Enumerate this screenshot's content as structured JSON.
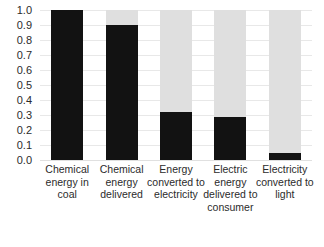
{
  "chart_data": {
    "type": "bar",
    "title": "",
    "subtitle": "",
    "xlabel": "",
    "ylabel": "",
    "categories": [
      "Chemical energy in coal",
      "Chemical energy delivered",
      "Energy converted to electricity",
      "Electric energy delivered to consumer",
      "Electricity converted to light"
    ],
    "series": [
      {
        "name": "Fraction of original energy remaining",
        "values": [
          1.0,
          0.9,
          0.32,
          0.29,
          0.05
        ]
      },
      {
        "name": "Energy lost (remainder to 1.0)",
        "values": [
          0.0,
          0.1,
          0.68,
          0.71,
          0.95
        ]
      }
    ],
    "values": [
      1.0,
      0.9,
      0.32,
      0.29,
      0.05
    ],
    "ylim": [
      0.0,
      1.0
    ],
    "ytick_labels": [
      "1.0",
      "0.9",
      "0.8",
      "0.7",
      "0.6",
      "0.5",
      "0.4",
      "0.3",
      "0.2",
      "0.1",
      "0.0"
    ],
    "ytick_values": [
      1.0,
      0.9,
      0.8,
      0.7,
      0.6,
      0.5,
      0.4,
      0.3,
      0.2,
      0.1,
      0.0
    ],
    "grid": true,
    "legend": false,
    "legend_position": "none",
    "colors": {
      "fill": "#121212",
      "remainder": "#dfdfdf",
      "gridline": "#e8e8e8",
      "text": "#2b2b2b",
      "background": "#ffffff"
    }
  }
}
